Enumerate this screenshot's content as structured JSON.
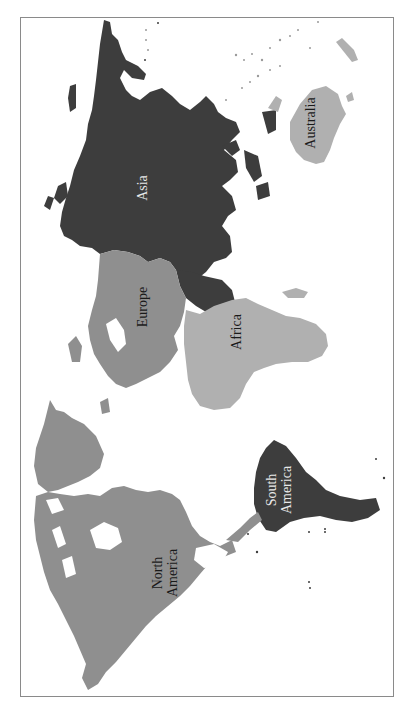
{
  "map": {
    "orientation": "rotated 90 degrees clockwise (north points right)",
    "colors": {
      "dark": "#3d3d3d",
      "medium": "#8f8f8f",
      "light": "#b0b0b0",
      "frame": "#8a8a8a",
      "background": "#ffffff"
    },
    "continents": [
      {
        "name": "Asia",
        "label": "Asia",
        "shade": "dark"
      },
      {
        "name": "Australia",
        "label": "Australia",
        "shade": "light"
      },
      {
        "name": "Europe",
        "label": "Europe",
        "shade": "medium"
      },
      {
        "name": "Africa",
        "label": "Africa",
        "shade": "light"
      },
      {
        "name": "South America",
        "label_line1": "South",
        "label_line2": "America",
        "shade": "dark"
      },
      {
        "name": "North America",
        "label_line1": "North",
        "label_line2": "America",
        "shade": "medium"
      }
    ]
  }
}
